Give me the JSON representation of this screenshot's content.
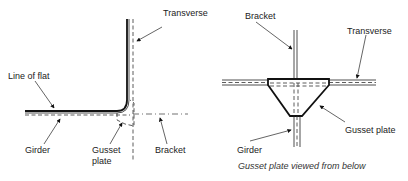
{
  "left_view": {
    "labels": {
      "transverse": "Transverse",
      "line_of_flat": "Line of flat",
      "girder": "Girder",
      "gusset_plate_line1": "Gusset",
      "gusset_plate_line2": "plate",
      "bracket": "Bracket"
    }
  },
  "right_view": {
    "labels": {
      "bracket": "Bracket",
      "transverse": "Transverse",
      "gusset_plate": "Gusset plate",
      "girder": "Girder"
    },
    "caption": "Gusset plate viewed from below"
  }
}
